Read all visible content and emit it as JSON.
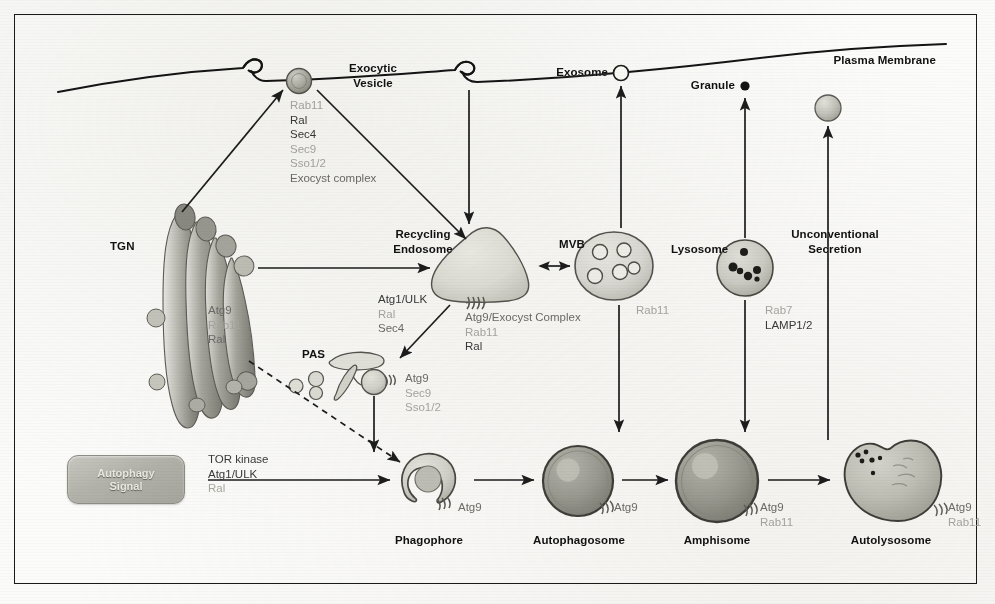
{
  "figure": {
    "background": "#fcfcfb",
    "frame_color": "#1a1a1a",
    "text_color": "#111111",
    "protein_color": "#4b4b4b",
    "faint_protein_color": "#a9a9a4"
  },
  "compartments": {
    "plasma_membrane": "Plasma Membrane",
    "exocytic_vesicle": "Exocytic\nVesicle",
    "exocytic_vesicle_line1": "Exocytic",
    "exocytic_vesicle_line2": "Vesicle",
    "tgn": "TGN",
    "recycling_endosome_line1": "Recycling",
    "recycling_endosome_line2": "Endosome",
    "mvb": "MVB",
    "lysosome": "Lysosome",
    "exosome": "Exosome",
    "granule": "Granule",
    "unconventional_secretion_line1": "Unconventional",
    "unconventional_secretion_line2": "Secretion",
    "pas": "PAS",
    "phagophore": "Phagophore",
    "autophagosome": "Autophagosome",
    "amphisome": "Amphisome",
    "autolysosome": "Autolysosome"
  },
  "signal_box": {
    "line1": "Autophagy",
    "line2": "Signal"
  },
  "protein_lists": {
    "exocytic_vesicle": [
      {
        "text": "Rab11",
        "tone": "faint"
      },
      {
        "text": "Ral",
        "tone": "dark"
      },
      {
        "text": "Sec4",
        "tone": "dark"
      },
      {
        "text": "Sec9",
        "tone": "faint"
      },
      {
        "text": "Sso1/2",
        "tone": "faint"
      },
      {
        "text": "Exocyst complex",
        "tone": "mid"
      }
    ],
    "tgn": [
      {
        "text": "Atg9",
        "tone": "mid"
      },
      {
        "text": "Rab11",
        "tone": "faint"
      },
      {
        "text": "Ral",
        "tone": "mid"
      }
    ],
    "autophagy_signal": [
      {
        "text": "TOR kinase",
        "tone": "dark"
      },
      {
        "text": "Atg1/ULK",
        "tone": "dark"
      },
      {
        "text": "Ral",
        "tone": "faint"
      }
    ],
    "pas_induction": [
      {
        "text": "Atg1/ULK",
        "tone": "dark"
      },
      {
        "text": "Ral",
        "tone": "faint"
      },
      {
        "text": "Sec4",
        "tone": "mid"
      }
    ],
    "pas_site": [
      {
        "text": "Atg9",
        "tone": "mid"
      },
      {
        "text": "Sec9",
        "tone": "faint"
      },
      {
        "text": "Sso1/2",
        "tone": "faint"
      }
    ],
    "recycling_endosome": [
      {
        "text": "Atg9/Exocyst Complex",
        "tone": "mid"
      },
      {
        "text": "Rab11",
        "tone": "faint"
      },
      {
        "text": "Ral",
        "tone": "dark"
      }
    ],
    "mvb": [
      {
        "text": "Rab11",
        "tone": "faint"
      }
    ],
    "lysosome": [
      {
        "text": "Rab7",
        "tone": "faint"
      },
      {
        "text": "LAMP1/2",
        "tone": "dark"
      }
    ],
    "phagophore": [
      {
        "text": "Atg9",
        "tone": "mid"
      }
    ],
    "autophagosome": [
      {
        "text": "Atg9",
        "tone": "mid"
      }
    ],
    "amphisome": [
      {
        "text": "Atg9",
        "tone": "mid"
      },
      {
        "text": "Rab11",
        "tone": "faint"
      }
    ],
    "autolysosome": [
      {
        "text": "Atg9",
        "tone": "mid"
      },
      {
        "text": "Rab11",
        "tone": "faint"
      }
    ]
  },
  "pathway_edges": [
    {
      "from": "TGN",
      "to": "Exocytic Vesicle",
      "style": "solid"
    },
    {
      "from": "Exocytic Vesicle",
      "to": "Recycling Endosome",
      "style": "solid"
    },
    {
      "from": "Plasma Membrane",
      "to": "Recycling Endosome",
      "style": "solid"
    },
    {
      "from": "TGN",
      "to": "Recycling Endosome",
      "style": "solid"
    },
    {
      "from": "Recycling Endosome",
      "to": "MVB",
      "style": "double"
    },
    {
      "from": "Recycling Endosome",
      "to": "PAS",
      "style": "solid"
    },
    {
      "from": "TGN",
      "to": "Phagophore",
      "style": "dashed"
    },
    {
      "from": "PAS",
      "to": "Phagophore",
      "style": "solid"
    },
    {
      "from": "Autophagy Signal",
      "to": "Phagophore",
      "style": "solid"
    },
    {
      "from": "Phagophore",
      "to": "Autophagosome",
      "style": "solid"
    },
    {
      "from": "Autophagosome",
      "to": "Amphisome",
      "style": "solid"
    },
    {
      "from": "MVB",
      "to": "Amphisome",
      "style": "solid"
    },
    {
      "from": "MVB",
      "to": "Exosome",
      "style": "solid"
    },
    {
      "from": "Amphisome",
      "to": "Autolysosome",
      "style": "solid"
    },
    {
      "from": "Lysosome",
      "to": "Autolysosome",
      "style": "solid"
    },
    {
      "from": "Lysosome",
      "to": "Granule",
      "style": "solid"
    },
    {
      "from": "Autolysosome",
      "to": "Unconventional Secretion",
      "style": "solid"
    }
  ]
}
